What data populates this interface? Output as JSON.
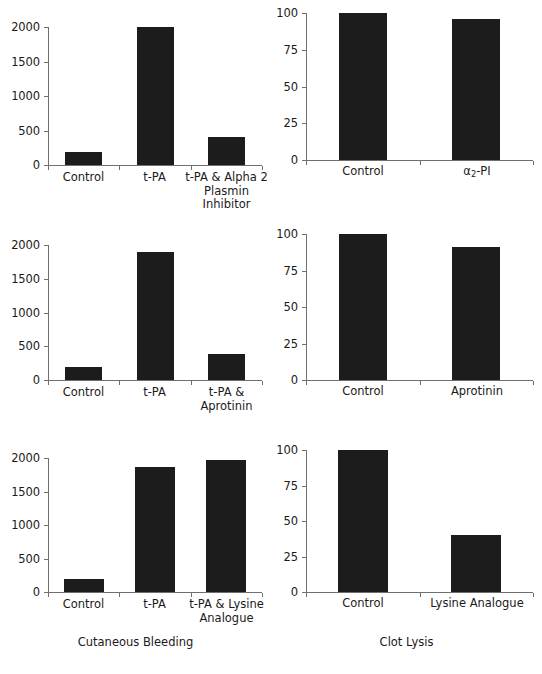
{
  "figure": {
    "background_color": "#ffffff",
    "ink_color": "#1c1c1c",
    "axis_color": "#6f6f6f"
  },
  "captions": {
    "left_column": "Cutaneous Bleeding",
    "right_column": "Clot Lysis"
  },
  "chart_data": [
    {
      "id": "bleeding-alpha2-pi",
      "type": "bar",
      "title": "",
      "xlabel": "",
      "ylabel": "",
      "categories": [
        "Control",
        "t-PA",
        "t-PA & Alpha 2\nPlasmin Inhibitor"
      ],
      "values": [
        195,
        2000,
        410
      ],
      "ylim": [
        0,
        2000
      ],
      "yticks": [
        0,
        500,
        1000,
        1500,
        2000
      ],
      "ytick_labels": [
        "0",
        "500",
        "1000",
        "1500",
        "2000"
      ],
      "grid": false,
      "legend": "none"
    },
    {
      "id": "clotlysis-alpha2-pi",
      "type": "bar",
      "title": "",
      "xlabel": "",
      "ylabel": "",
      "categories": [
        "Control",
        "α₂-PI"
      ],
      "category_html": [
        "Control",
        "&alpha;<span class=\"sub\">2</span>-PI"
      ],
      "values": [
        100,
        96
      ],
      "ylim": [
        0,
        100
      ],
      "yticks": [
        0,
        25,
        50,
        75,
        100
      ],
      "ytick_labels": [
        "0",
        "25",
        "50",
        "75",
        "100"
      ],
      "grid": false,
      "legend": "none"
    },
    {
      "id": "bleeding-aprotinin",
      "type": "bar",
      "title": "",
      "xlabel": "",
      "ylabel": "",
      "categories": [
        "Control",
        "t-PA",
        "t-PA &\nAprotinin"
      ],
      "values": [
        195,
        1900,
        390
      ],
      "ylim": [
        0,
        2000
      ],
      "yticks": [
        0,
        500,
        1000,
        1500,
        2000
      ],
      "ytick_labels": [
        "0",
        "500",
        "1000",
        "1500",
        "2000"
      ],
      "grid": false,
      "legend": "none"
    },
    {
      "id": "clotlysis-aprotinin",
      "type": "bar",
      "title": "",
      "xlabel": "",
      "ylabel": "",
      "categories": [
        "Control",
        "Aprotinin"
      ],
      "values": [
        100,
        91
      ],
      "ylim": [
        0,
        100
      ],
      "yticks": [
        0,
        25,
        50,
        75,
        100
      ],
      "ytick_labels": [
        "0",
        "25",
        "50",
        "75",
        "100"
      ],
      "grid": false,
      "legend": "none"
    },
    {
      "id": "bleeding-lysine-analogue",
      "type": "bar",
      "title": "",
      "xlabel": "",
      "ylabel": "",
      "categories": [
        "Control",
        "t-PA",
        "t-PA & Lysine\nAnalogue"
      ],
      "values": [
        195,
        1870,
        1975
      ],
      "ylim": [
        0,
        2000
      ],
      "yticks": [
        0,
        500,
        1000,
        1500,
        2000
      ],
      "ytick_labels": [
        "0",
        "500",
        "1000",
        "1500",
        "2000"
      ],
      "grid": false,
      "legend": "none"
    },
    {
      "id": "clotlysis-lysine-analogue",
      "type": "bar",
      "title": "",
      "xlabel": "",
      "ylabel": "",
      "categories": [
        "Control",
        "Lysine Analogue"
      ],
      "values": [
        100,
        40
      ],
      "ylim": [
        0,
        100
      ],
      "yticks": [
        0,
        25,
        50,
        75,
        100
      ],
      "ytick_labels": [
        "0",
        "25",
        "50",
        "75",
        "100"
      ],
      "grid": false,
      "legend": "none"
    }
  ]
}
